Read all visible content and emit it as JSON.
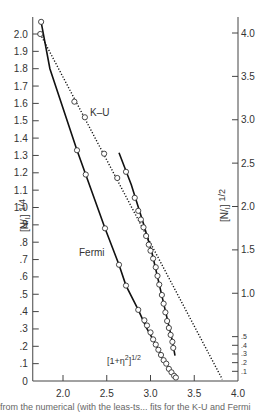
{
  "chart_data": {
    "type": "line",
    "title": "",
    "xlabel": "",
    "ylabel_left": "[N/I] 1/4",
    "ylabel_right": "[N/I] 1/2",
    "xlim": [
      1.7,
      4.0
    ],
    "ylim_left": [
      0,
      2.1
    ],
    "ylim_right": [
      0,
      4.2
    ],
    "x_ticks": [
      "2.0",
      "2.5",
      "3.0",
      "3.5",
      "4.0"
    ],
    "x_tick_values": [
      2.0,
      2.5,
      3.0,
      3.5,
      4.0
    ],
    "y_left_ticks": [
      "0",
      ".1",
      ".2",
      ".3",
      ".4",
      ".5",
      ".6",
      ".7",
      ".8",
      ".9",
      "1.0",
      "1.1",
      "1.2",
      "1.3",
      "1.4",
      "1.5",
      "1.6",
      "1.7",
      "1.8",
      "1.9",
      "2.0"
    ],
    "y_left_tick_values": [
      0,
      0.1,
      0.2,
      0.3,
      0.4,
      0.5,
      0.6,
      0.7,
      0.8,
      0.9,
      1.0,
      1.1,
      1.2,
      1.3,
      1.4,
      1.5,
      1.6,
      1.7,
      1.8,
      1.9,
      2.0
    ],
    "y_right_ticks": [
      ".1",
      ".2",
      ".3",
      ".4",
      ".5",
      "1.0",
      "1.5",
      "2.0",
      "2.5",
      "3.0",
      "3.5",
      "4.0"
    ],
    "y_right_tick_values": [
      0.1,
      0.2,
      0.3,
      0.4,
      0.5,
      1.0,
      1.5,
      2.0,
      2.5,
      3.0,
      3.5,
      4.0
    ],
    "grid": false,
    "series": [
      {
        "name": "Fermi",
        "axis": "left",
        "style": "solid",
        "line": [
          [
            1.75,
            2.07
          ],
          [
            1.85,
            1.8
          ],
          [
            2.16,
            1.33
          ],
          [
            2.26,
            1.19
          ],
          [
            2.48,
            0.88
          ],
          [
            2.64,
            0.67
          ],
          [
            2.72,
            0.55
          ],
          [
            2.86,
            0.41
          ],
          [
            2.95,
            0.31
          ],
          [
            3.05,
            0.22
          ],
          [
            3.14,
            0.13
          ],
          [
            3.24,
            0.05
          ],
          [
            3.28,
            0.02
          ]
        ],
        "points": [
          [
            1.75,
            2.07
          ],
          [
            2.16,
            1.33
          ],
          [
            2.26,
            1.19
          ],
          [
            2.48,
            0.88
          ],
          [
            2.64,
            0.67
          ],
          [
            2.72,
            0.55
          ],
          [
            2.86,
            0.41
          ],
          [
            2.93,
            0.35
          ],
          [
            2.96,
            0.32
          ],
          [
            3.0,
            0.28
          ],
          [
            3.03,
            0.24
          ],
          [
            3.06,
            0.21
          ],
          [
            3.09,
            0.18
          ],
          [
            3.12,
            0.15
          ],
          [
            3.15,
            0.12
          ],
          [
            3.18,
            0.1
          ],
          [
            3.21,
            0.07
          ],
          [
            3.24,
            0.05
          ],
          [
            3.27,
            0.03
          ],
          [
            3.29,
            0.02
          ]
        ]
      },
      {
        "name": "K-U",
        "axis": "left",
        "style": "dotted",
        "line": [
          [
            1.74,
            2.0
          ],
          [
            3.82,
            0.01
          ]
        ],
        "points": [
          [
            1.74,
            2.0
          ],
          [
            2.13,
            1.61
          ],
          [
            2.25,
            1.52
          ],
          [
            2.47,
            1.31
          ],
          [
            2.62,
            1.17
          ]
        ]
      },
      {
        "name": "[1+η²]1/2",
        "axis": "right",
        "style": "solid",
        "line": [
          [
            2.64,
            2.62
          ],
          [
            2.78,
            2.25
          ],
          [
            2.92,
            1.8
          ],
          [
            3.02,
            1.45
          ],
          [
            3.1,
            1.1
          ],
          [
            3.18,
            0.75
          ],
          [
            3.25,
            0.45
          ],
          [
            3.28,
            0.28
          ]
        ],
        "points": [
          [
            2.72,
            2.4
          ],
          [
            2.82,
            2.1
          ],
          [
            2.86,
            1.95
          ],
          [
            2.89,
            1.85
          ],
          [
            2.92,
            1.76
          ],
          [
            2.95,
            1.66
          ],
          [
            2.98,
            1.56
          ],
          [
            3.0,
            1.49
          ],
          [
            3.03,
            1.4
          ],
          [
            3.06,
            1.3
          ],
          [
            3.08,
            1.2
          ],
          [
            3.1,
            1.1
          ],
          [
            3.13,
            0.98
          ],
          [
            3.15,
            0.88
          ],
          [
            3.17,
            0.78
          ],
          [
            3.19,
            0.68
          ],
          [
            3.21,
            0.6
          ],
          [
            3.23,
            0.52
          ],
          [
            3.25,
            0.44
          ],
          [
            3.26,
            0.37
          ]
        ]
      }
    ],
    "annotations": [
      {
        "text": "K–U",
        "x": 2.3,
        "y_left": 1.55
      },
      {
        "text": "Fermi",
        "x": 2.02,
        "y_left": 0.64
      },
      {
        "text": "[1+η²]1/2",
        "x": 2.72,
        "y_left": 0.08
      }
    ]
  },
  "labels": {
    "ku": "K–U",
    "fermi": "Fermi",
    "eta_base": "[1+η",
    "eta_sup2": "2",
    "eta_close": "]",
    "eta_pow": "1/2",
    "yleft_base": "[N/",
    "yleft_sub": "I",
    "yleft_close": "]",
    "yleft_pow": "1/4",
    "yright_base": "[N/",
    "yright_sub": "I",
    "yright_close": "]",
    "yright_pow": "1/2"
  },
  "caption": "from the numerical (with the leas-ts... fits for the K-U and Fermi"
}
